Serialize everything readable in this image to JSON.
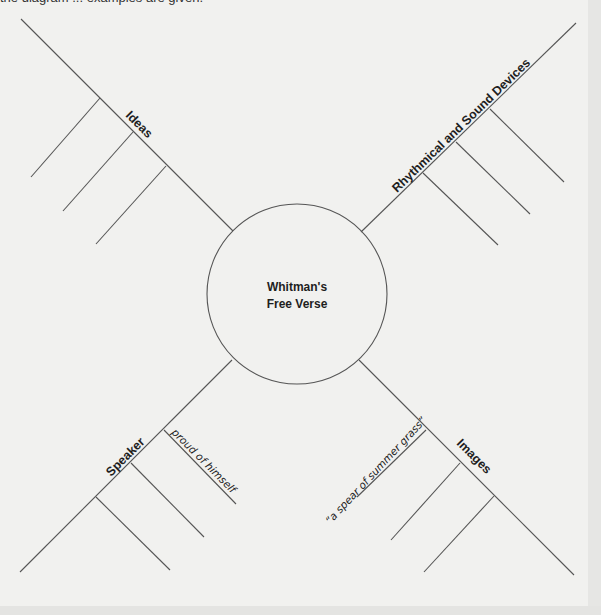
{
  "header": {
    "instruction_clipped": "the diagram ... examples are given."
  },
  "diagram": {
    "center": {
      "line1": "Whitman's",
      "line2": "Free Verse"
    },
    "branches": [
      {
        "id": "ideas",
        "label": "Ideas",
        "entries": [
          "",
          "",
          ""
        ]
      },
      {
        "id": "rhythmical",
        "label": "Rhythmical and Sound Devices",
        "entries": [
          "",
          "",
          ""
        ]
      },
      {
        "id": "speaker",
        "label": "Speaker",
        "entries": [
          "proud of himself",
          "",
          ""
        ]
      },
      {
        "id": "images",
        "label": "Images",
        "entries": [
          "“a spear of summer grass”",
          "",
          ""
        ]
      }
    ]
  },
  "colors": {
    "background": "#f1f1ef",
    "line": "#555555",
    "text": "#1e1e1e"
  }
}
